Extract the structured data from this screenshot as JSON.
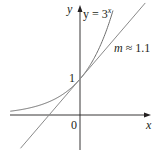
{
  "chart_data": {
    "type": "line",
    "title": "",
    "xlabel": "x",
    "ylabel": "y",
    "origin_label": "0",
    "tick_labels": {
      "y": [
        "1"
      ]
    },
    "grid": false,
    "series": [
      {
        "name": "y = 3^x",
        "label": "y = 3",
        "label_exp": "x",
        "kind": "curve",
        "function": "3^x",
        "color": "#6e6e6e"
      },
      {
        "name": "tangent m ≈ 1.1",
        "label": "m ≈ 1.1",
        "kind": "line",
        "slope": 1.1,
        "intercept": 1,
        "color": "#8a8a8a"
      }
    ],
    "annotations": [
      {
        "text": "y = 3^x",
        "near": "curve top"
      },
      {
        "text": "m ≈ 1.1",
        "near": "tangent line upper right"
      },
      {
        "text": "1",
        "at": [
          0,
          1
        ]
      }
    ],
    "xlim": [
      -2.3,
      2.2
    ],
    "ylim": [
      -1.3,
      3.2
    ]
  },
  "labels": {
    "y_axis": "y",
    "x_axis": "x",
    "origin": "0",
    "one": "1",
    "curve_base": "y = 3",
    "curve_exp": "x",
    "m_var": "m",
    "m_rest": " ≈ 1.1"
  }
}
